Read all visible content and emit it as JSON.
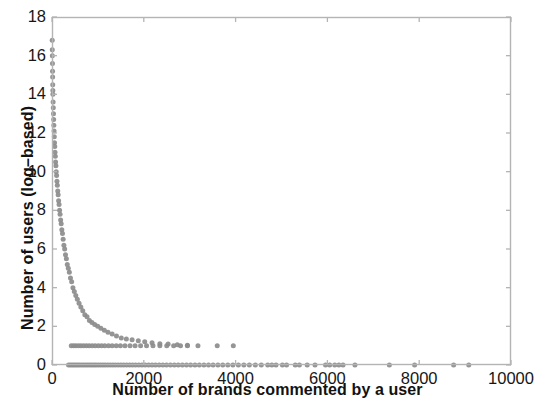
{
  "chart_data": {
    "type": "scatter",
    "title": "",
    "xlabel": "Number of brands commented by a user",
    "ylabel": "Number of users (log–based)",
    "xlim": [
      0,
      10000
    ],
    "ylim": [
      0,
      18
    ],
    "xticks": [
      0,
      2000,
      4000,
      6000,
      8000,
      10000
    ],
    "yticks": [
      0,
      2,
      4,
      6,
      8,
      10,
      12,
      14,
      16,
      18
    ],
    "xtick_labels": [
      "0",
      "2000",
      "4000",
      "6000",
      "8000",
      "10000"
    ],
    "ytick_labels": [
      "0",
      "2",
      "4",
      "6",
      "8",
      "10",
      "12",
      "14",
      "16",
      "18"
    ],
    "grid": false,
    "legend": null,
    "marker": {
      "shape": "circle",
      "color": "#8c8c8c",
      "size_px": 5
    },
    "frame_color": "#b4b4b4",
    "background": "#ffffff",
    "points": [
      [
        5,
        16.8
      ],
      [
        6,
        16.3
      ],
      [
        8,
        16.0
      ],
      [
        10,
        15.6
      ],
      [
        12,
        15.2
      ],
      [
        14,
        14.9
      ],
      [
        16,
        14.5
      ],
      [
        18,
        14.2
      ],
      [
        20,
        14.0
      ],
      [
        24,
        13.6
      ],
      [
        28,
        13.3
      ],
      [
        32,
        13.0
      ],
      [
        36,
        12.7
      ],
      [
        40,
        12.4
      ],
      [
        45,
        12.1
      ],
      [
        50,
        11.8
      ],
      [
        55,
        11.5
      ],
      [
        60,
        11.3
      ],
      [
        66,
        11.0
      ],
      [
        72,
        10.8
      ],
      [
        78,
        10.5
      ],
      [
        85,
        10.3
      ],
      [
        92,
        10.0
      ],
      [
        100,
        9.8
      ],
      [
        108,
        9.5
      ],
      [
        116,
        9.3
      ],
      [
        125,
        9.0
      ],
      [
        134,
        8.8
      ],
      [
        144,
        8.5
      ],
      [
        154,
        8.3
      ],
      [
        165,
        8.0
      ],
      [
        176,
        7.8
      ],
      [
        188,
        7.5
      ],
      [
        200,
        7.3
      ],
      [
        214,
        7.0
      ],
      [
        228,
        6.8
      ],
      [
        243,
        6.5
      ],
      [
        259,
        6.2
      ],
      [
        276,
        6.0
      ],
      [
        294,
        5.7
      ],
      [
        313,
        5.5
      ],
      [
        333,
        5.2
      ],
      [
        355,
        5.0
      ],
      [
        378,
        4.8
      ],
      [
        402,
        4.5
      ],
      [
        428,
        4.3
      ],
      [
        456,
        4.0
      ],
      [
        486,
        3.8
      ],
      [
        518,
        3.6
      ],
      [
        552,
        3.4
      ],
      [
        589,
        3.2
      ],
      [
        628,
        3.0
      ],
      [
        670,
        2.8
      ],
      [
        715,
        2.6
      ],
      [
        763,
        2.5
      ],
      [
        815,
        2.3
      ],
      [
        870,
        2.2
      ],
      [
        930,
        2.1
      ],
      [
        995,
        2.0
      ],
      [
        1065,
        1.9
      ],
      [
        1140,
        1.8
      ],
      [
        1220,
        1.7
      ],
      [
        1310,
        1.6
      ],
      [
        1405,
        1.5
      ],
      [
        1510,
        1.4
      ],
      [
        1620,
        1.35
      ],
      [
        1745,
        1.3
      ],
      [
        1880,
        1.25
      ],
      [
        2020,
        1.2
      ],
      [
        2180,
        1.15
      ],
      [
        2350,
        1.1
      ],
      [
        2530,
        1.08
      ],
      [
        2730,
        1.05
      ],
      [
        2950,
        1.02
      ],
      [
        3180,
        1.0
      ],
      [
        3600,
        1.0
      ],
      [
        3950,
        1.0
      ],
      [
        420,
        1.0
      ],
      [
        470,
        1.0
      ],
      [
        520,
        1.0
      ],
      [
        575,
        1.0
      ],
      [
        630,
        1.0
      ],
      [
        690,
        1.0
      ],
      [
        750,
        1.0
      ],
      [
        810,
        1.0
      ],
      [
        875,
        1.0
      ],
      [
        940,
        1.0
      ],
      [
        1010,
        1.0
      ],
      [
        1080,
        1.0
      ],
      [
        1150,
        1.0
      ],
      [
        1230,
        1.0
      ],
      [
        1310,
        1.0
      ],
      [
        1400,
        1.0
      ],
      [
        1490,
        1.0
      ],
      [
        1590,
        1.0
      ],
      [
        1700,
        1.0
      ],
      [
        1810,
        1.0
      ],
      [
        1930,
        1.0
      ],
      [
        2060,
        1.0
      ],
      [
        2200,
        1.0
      ],
      [
        2350,
        1.0
      ],
      [
        2500,
        1.0
      ],
      [
        2650,
        1.0
      ],
      [
        2800,
        1.0
      ],
      [
        2950,
        1.0
      ],
      [
        360,
        0
      ],
      [
        400,
        0
      ],
      [
        440,
        0
      ],
      [
        480,
        0
      ],
      [
        520,
        0
      ],
      [
        560,
        0
      ],
      [
        600,
        0
      ],
      [
        645,
        0
      ],
      [
        690,
        0
      ],
      [
        735,
        0
      ],
      [
        780,
        0
      ],
      [
        825,
        0
      ],
      [
        870,
        0
      ],
      [
        915,
        0
      ],
      [
        960,
        0
      ],
      [
        1010,
        0
      ],
      [
        1060,
        0
      ],
      [
        1110,
        0
      ],
      [
        1160,
        0
      ],
      [
        1215,
        0
      ],
      [
        1270,
        0
      ],
      [
        1325,
        0
      ],
      [
        1380,
        0
      ],
      [
        1440,
        0
      ],
      [
        1500,
        0
      ],
      [
        1560,
        0
      ],
      [
        1625,
        0
      ],
      [
        1690,
        0
      ],
      [
        1755,
        0
      ],
      [
        1820,
        0
      ],
      [
        1890,
        0
      ],
      [
        1960,
        0
      ],
      [
        2030,
        0
      ],
      [
        2105,
        0
      ],
      [
        2180,
        0
      ],
      [
        2255,
        0
      ],
      [
        2335,
        0
      ],
      [
        2415,
        0
      ],
      [
        2495,
        0
      ],
      [
        2580,
        0
      ],
      [
        2665,
        0
      ],
      [
        2750,
        0
      ],
      [
        2840,
        0
      ],
      [
        2930,
        0
      ],
      [
        3020,
        0
      ],
      [
        3115,
        0
      ],
      [
        3210,
        0
      ],
      [
        3310,
        0
      ],
      [
        3410,
        0
      ],
      [
        3510,
        0
      ],
      [
        3615,
        0
      ],
      [
        3720,
        0
      ],
      [
        3830,
        0
      ],
      [
        3940,
        0
      ],
      [
        4060,
        0
      ],
      [
        4180,
        0
      ],
      [
        4300,
        0
      ],
      [
        4430,
        0
      ],
      [
        4560,
        0
      ],
      [
        4700,
        0
      ],
      [
        4790,
        0
      ],
      [
        4880,
        0
      ],
      [
        5020,
        0
      ],
      [
        5110,
        0
      ],
      [
        5300,
        0
      ],
      [
        5390,
        0
      ],
      [
        5560,
        0
      ],
      [
        5730,
        0
      ],
      [
        5960,
        0
      ],
      [
        6050,
        0
      ],
      [
        6160,
        0
      ],
      [
        6250,
        0
      ],
      [
        6340,
        0
      ],
      [
        6600,
        0
      ],
      [
        7350,
        0
      ],
      [
        7900,
        0
      ],
      [
        8750,
        0
      ],
      [
        9080,
        0
      ]
    ]
  },
  "axes": {
    "x_label": "Number of brands commented by a user",
    "y_label": "Number of users (log–based)"
  }
}
